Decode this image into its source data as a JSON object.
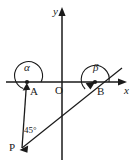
{
  "figure": {
    "stroke_color": "#1a1a1a",
    "background_color": "#ffffff",
    "axes": {
      "x_label": "x",
      "y_label": "y",
      "origin_label": "O",
      "origin_px": [
        62,
        82
      ],
      "x_axis_from_px": [
        6,
        82
      ],
      "x_axis_to_px": [
        126,
        82
      ],
      "y_axis_from_px": [
        62,
        160
      ],
      "y_axis_to_px": [
        62,
        9
      ]
    },
    "points": [
      {
        "label": "A",
        "x_px": 27,
        "y_px": 82,
        "on": "negative-x-axis"
      },
      {
        "label": "B",
        "x_px": 95,
        "y_px": 82,
        "on": "positive-x-axis"
      },
      {
        "label": "P",
        "x_px": 22,
        "y_px": 148,
        "on": "third-quadrant"
      },
      {
        "label": "O",
        "x_px": 62,
        "y_px": 82,
        "on": "origin"
      }
    ],
    "rays": [
      {
        "name": "ray-P-to-A",
        "from": "P",
        "to": "A",
        "arrow_at": "A"
      },
      {
        "name": "ray-P-to-B",
        "from": "P",
        "to": "B",
        "arrow_at": "B",
        "extends_beyond": true
      }
    ],
    "angles": [
      {
        "name": "angle-alpha-at-A",
        "label": "α",
        "vertex": "A",
        "label_x_px": 24,
        "label_y_px": 62
      },
      {
        "name": "angle-beta-at-B",
        "label": "β",
        "vertex": "B",
        "label_x_px": 93,
        "label_y_px": 62
      },
      {
        "name": "angle-45-at-P",
        "label": "45°",
        "vertex": "P",
        "label_x_px": 24,
        "label_y_px": 126
      }
    ]
  }
}
